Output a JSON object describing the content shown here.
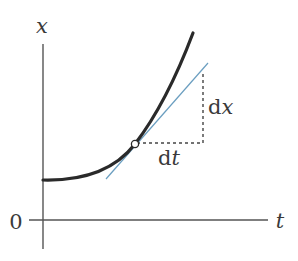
{
  "diagram": {
    "labels": {
      "y_axis": "x",
      "x_axis": "t",
      "origin": "0",
      "dx": "d",
      "dx_var": "x",
      "dt": "d",
      "dt_var": "t"
    },
    "colors": {
      "axis": "#555555",
      "curve": "#2a2a2a",
      "tangent": "#6a9ec0",
      "guide": "#444444",
      "text": "#3a3a3a"
    }
  }
}
